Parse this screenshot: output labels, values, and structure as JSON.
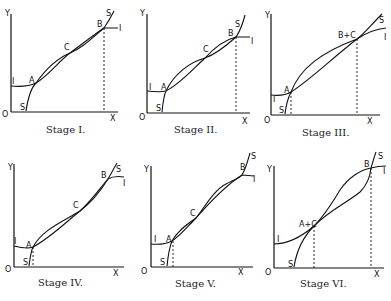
{
  "figure": {
    "axis_labels": {
      "origin": "O",
      "x": "X",
      "y": "Y"
    },
    "curve_labels": {
      "s": "S",
      "i": "I"
    },
    "stages": [
      {
        "caption": "Stage I.",
        "points": {
          "a": "A",
          "c": "C",
          "b": "B"
        }
      },
      {
        "caption": "Stage II.",
        "points": {
          "a": "A",
          "c": "C",
          "b": "B"
        }
      },
      {
        "caption": "Stage III.",
        "points": {
          "a": "A",
          "bc": "B+C"
        }
      },
      {
        "caption": "Stage IV.",
        "points": {
          "a": "A",
          "c": "C",
          "b": "B"
        }
      },
      {
        "caption": "Stage V.",
        "points": {
          "a": "A",
          "c": "C",
          "b": "B"
        }
      },
      {
        "caption": "Stage VI.",
        "points": {
          "ac": "A+C",
          "b": "B"
        }
      }
    ]
  }
}
